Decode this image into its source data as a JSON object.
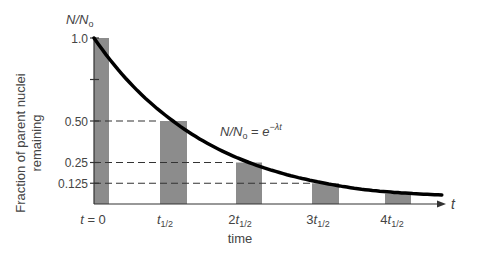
{
  "chart_data": {
    "type": "bar",
    "title": "",
    "subtitle": "",
    "xlabel": "time",
    "ylabel": "Fraction of parent nuclei remaining",
    "ylabel_lines": [
      "Fraction of parent nuclei",
      "remaining"
    ],
    "y_axis_symbol": "N/N₀",
    "x_axis_symbol": "t",
    "categories": [
      "t = 0",
      "t1/2",
      "2t1/2",
      "3t1/2",
      "4t1/2"
    ],
    "category_display": [
      {
        "pre": "t = 0",
        "sub": ""
      },
      {
        "pre": "t",
        "sub": "1/2"
      },
      {
        "pre": "2t",
        "sub": "1/2"
      },
      {
        "pre": "3t",
        "sub": "1/2"
      },
      {
        "pre": "4t",
        "sub": "1/2"
      }
    ],
    "values": [
      1.0,
      0.5,
      0.25,
      0.125,
      0.0625
    ],
    "series": [
      {
        "name": "Fraction remaining (bars)",
        "values": [
          1.0,
          0.5,
          0.25,
          0.125,
          0.0625
        ]
      },
      {
        "name": "N/N₀ = e^(−λt) (curve)",
        "type": "line",
        "x": [
          0,
          1,
          2,
          3,
          4,
          4.6
        ],
        "values": [
          1.0,
          0.5,
          0.25,
          0.125,
          0.0625,
          0.041
        ]
      }
    ],
    "yticks": [
      {
        "value": 1.0,
        "label": "1.0"
      },
      {
        "value": 0.75,
        "label": ""
      },
      {
        "value": 0.5,
        "label": "0.50"
      },
      {
        "value": 0.25,
        "label": "0.25"
      },
      {
        "value": 0.125,
        "label": "0.125"
      }
    ],
    "annotation": {
      "text_main": "N/N₀ = e",
      "text_sup": "−λt"
    },
    "reference_lines": [
      {
        "y": 0.5,
        "style": "dashed",
        "to_category": 1
      },
      {
        "y": 0.25,
        "style": "dashed",
        "to_category": 2
      },
      {
        "y": 0.125,
        "style": "dashed",
        "to_category": 3
      }
    ],
    "ylim": [
      0,
      1.0
    ],
    "grid": false,
    "legend": "none",
    "colors": {
      "bar": "#8c8c8c",
      "curve": "#000000",
      "axis": "#333333",
      "text": "#444444"
    }
  }
}
